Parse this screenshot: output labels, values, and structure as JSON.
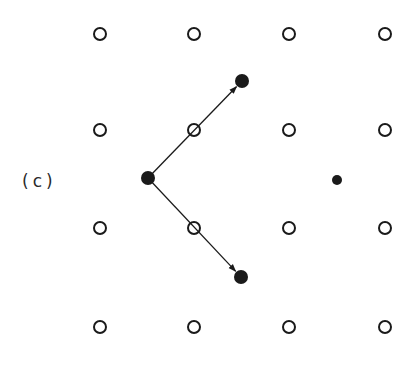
{
  "figure": {
    "panel_label": "(c)",
    "colors": {
      "ink": "#1a1a1a",
      "background": "#ffffff"
    },
    "lattice": {
      "columns_x": [
        100,
        194,
        289,
        385
      ],
      "rows_y": [
        34,
        130,
        228,
        327
      ],
      "open_circle_radius": 6
    },
    "filled_points": [
      {
        "id": "origin",
        "x": 148,
        "y": 178,
        "r": 7
      },
      {
        "id": "upper-target",
        "x": 242,
        "y": 81,
        "r": 7
      },
      {
        "id": "lower-target",
        "x": 241,
        "y": 277,
        "r": 7
      },
      {
        "id": "right-point",
        "x": 337,
        "y": 180,
        "r": 5
      }
    ],
    "arrows": [
      {
        "id": "arrow-up",
        "from": "origin",
        "to": "upper-target"
      },
      {
        "id": "arrow-down",
        "from": "origin",
        "to": "lower-target"
      }
    ]
  }
}
